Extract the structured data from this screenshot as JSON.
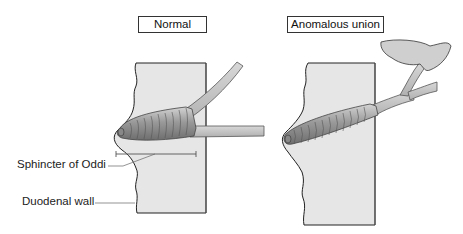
{
  "panels": {
    "normal": {
      "title": "Normal"
    },
    "anomalous": {
      "title": "Anomalous union"
    }
  },
  "labels": {
    "sphincter": "Sphincter of Oddi",
    "duodenal_wall": "Duodenal wall"
  },
  "colors": {
    "wall_fill": "#e6e6e6",
    "duct_fill": "#c4c4c4",
    "sphincter_dark": "#7a7a7a",
    "sphincter_light": "#c8c8c8",
    "outline": "#222222",
    "leader_line": "#555555"
  }
}
